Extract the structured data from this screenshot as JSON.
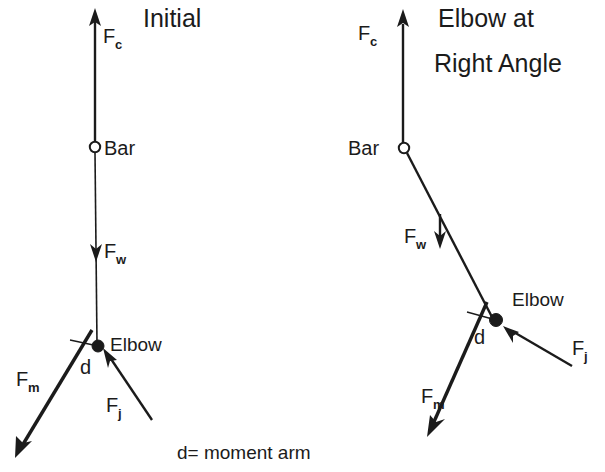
{
  "figure": {
    "caption": "d= moment arm",
    "stroke_color": "#1b1b1b",
    "background_color": "#ffffff"
  },
  "panels": [
    {
      "id": "initial",
      "title": "Initial",
      "title_lines": [
        "Initial"
      ],
      "labels": {
        "bar": "Bar",
        "elbow": "Elbow",
        "moment_arm": "d",
        "force_c": "F",
        "force_c_sub": "c",
        "force_w": "F",
        "force_w_sub": "w",
        "force_m": "F",
        "force_m_sub": "m",
        "force_j": "F",
        "force_j_sub": "j"
      }
    },
    {
      "id": "right-angle",
      "title": "Elbow at Right Angle",
      "title_lines": [
        "Elbow at",
        "Right Angle"
      ],
      "labels": {
        "bar": "Bar",
        "elbow": "Elbow",
        "moment_arm": "d",
        "force_c": "F",
        "force_c_sub": "c",
        "force_w": "F",
        "force_w_sub": "w",
        "force_m": "F",
        "force_m_sub": "m",
        "force_j": "F",
        "force_j_sub": "j"
      }
    }
  ]
}
